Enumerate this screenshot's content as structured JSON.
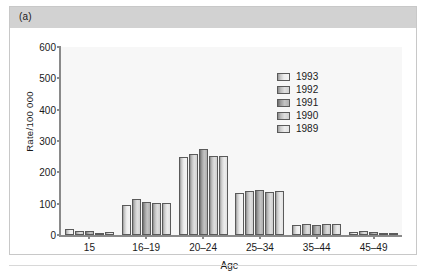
{
  "panel": {
    "label": "(a)"
  },
  "chart_data": {
    "type": "bar",
    "title": "",
    "xlabel": "Age",
    "ylabel": "Rate/100 000",
    "categories": [
      "15",
      "16–19",
      "20–24",
      "25–34",
      "35–44",
      "45–49"
    ],
    "yticks": [
      0,
      100,
      200,
      300,
      400,
      500,
      600
    ],
    "ylim": [
      0,
      600
    ],
    "grid": false,
    "legend_position": "upper right",
    "series": [
      {
        "name": "1993",
        "values": [
          20,
          95,
          250,
          134,
          31,
          9
        ]
      },
      {
        "name": "1992",
        "values": [
          13,
          115,
          258,
          139,
          36,
          12
        ]
      },
      {
        "name": "1991",
        "values": [
          14,
          105,
          275,
          144,
          32,
          9
        ]
      },
      {
        "name": "1990",
        "values": [
          8,
          101,
          252,
          138,
          34,
          8
        ]
      },
      {
        "name": "1989",
        "values": [
          10,
          101,
          252,
          139,
          35,
          8
        ]
      }
    ]
  }
}
